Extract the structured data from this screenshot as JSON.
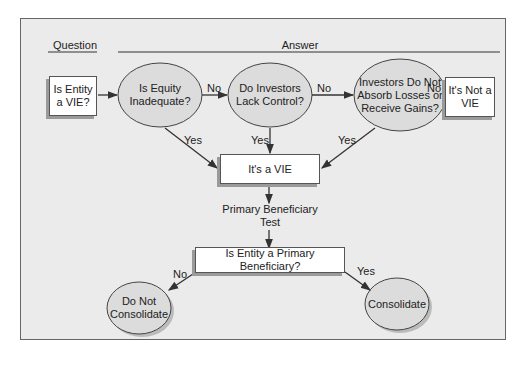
{
  "headers": {
    "question": "Question",
    "answer": "Answer"
  },
  "nodes": {
    "start": "Is Entity a VIE?",
    "q1": "Is Equity Inadequate?",
    "q2": "Do Investors Lack Control?",
    "q3": "Investors Do Not Absorb Losses or Receive Gains?",
    "not_vie": "It's Not a VIE",
    "is_vie": "It's a VIE",
    "pb_test": "Primary Beneficiary Test",
    "pb_question": "Is Entity a Primary Beneficiary?",
    "no_consolidate": "Do Not Consolidate",
    "consolidate": "Consolidate"
  },
  "edges": {
    "q1_no": "No",
    "q2_no": "No",
    "q3_no": "No",
    "q1_yes": "Yes",
    "q2_yes": "Yes",
    "q3_yes": "Yes",
    "pb_no": "No",
    "pb_yes": "Yes"
  },
  "colors": {
    "background": "#ebebeb",
    "ellipse_fill": "#dcdcdc",
    "box_fill": "#ffffff",
    "line": "#333333"
  }
}
